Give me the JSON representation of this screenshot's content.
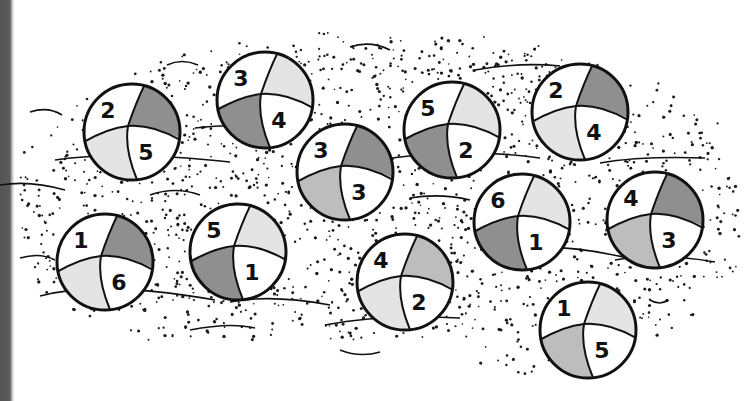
{
  "illustration": {
    "title": "Beach balls on sand",
    "colors": {
      "outline": "#111111",
      "white": "#ffffff",
      "light_shade": "#e4e4e4",
      "mid_shade": "#bdbdbd",
      "dark_shade": "#8f8f8f",
      "sand_dot": "#1a1a1a",
      "sidebar": "#5a5a5a"
    },
    "balls": [
      {
        "id": 1,
        "top_left": "2",
        "bottom_right": "5",
        "top_right_shade": "dark",
        "bottom_left_shade": "light"
      },
      {
        "id": 2,
        "top_left": "3",
        "bottom_right": "4",
        "top_right_shade": "light",
        "bottom_left_shade": "dark"
      },
      {
        "id": 3,
        "top_left": "3",
        "bottom_right": "3",
        "top_right_shade": "dark",
        "bottom_left_shade": "mid"
      },
      {
        "id": 4,
        "top_left": "5",
        "bottom_right": "2",
        "top_right_shade": "light",
        "bottom_left_shade": "dark"
      },
      {
        "id": 5,
        "top_left": "2",
        "bottom_right": "4",
        "top_right_shade": "dark",
        "bottom_left_shade": "light"
      },
      {
        "id": 6,
        "top_left": "1",
        "bottom_right": "6",
        "top_right_shade": "dark",
        "bottom_left_shade": "light"
      },
      {
        "id": 7,
        "top_left": "5",
        "bottom_right": "1",
        "top_right_shade": "light",
        "bottom_left_shade": "dark"
      },
      {
        "id": 8,
        "top_left": "4",
        "bottom_right": "2",
        "top_right_shade": "mid",
        "bottom_left_shade": "light"
      },
      {
        "id": 9,
        "top_left": "6",
        "bottom_right": "1",
        "top_right_shade": "light",
        "bottom_left_shade": "dark"
      },
      {
        "id": 10,
        "top_left": "4",
        "bottom_right": "3",
        "top_right_shade": "dark",
        "bottom_left_shade": "mid"
      },
      {
        "id": 11,
        "top_left": "1",
        "bottom_right": "5",
        "top_right_shade": "light",
        "bottom_left_shade": "mid"
      }
    ]
  }
}
